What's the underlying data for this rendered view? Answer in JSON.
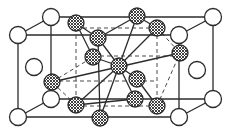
{
  "diagram": {
    "title": "",
    "type": "crystal-lattice-unit-cell",
    "colors": {
      "line": "#2b2b2b",
      "dashed": "#4a4a4a",
      "white_atom": "#ffffff",
      "hatch": "#2b2b2b"
    },
    "atom_radius": {
      "white": 8.5,
      "hatched": 8
    },
    "front_face": {
      "x1": 18,
      "y1": 35,
      "x2": 179,
      "y2": 117
    },
    "back_face": {
      "x1": 51,
      "y1": 17,
      "x2": 213,
      "y2": 99
    },
    "inner_dashed_box": {
      "x1": 76,
      "y1": 28,
      "x2": 157,
      "y2": 106
    },
    "white_atoms": [
      {
        "id": "corner-front-top-left",
        "x": 18,
        "y": 35
      },
      {
        "id": "corner-back-top-left",
        "x": 51,
        "y": 17
      },
      {
        "id": "corner-back-top-right",
        "x": 213,
        "y": 17
      },
      {
        "id": "corner-front-top-right",
        "x": 179,
        "y": 35
      },
      {
        "id": "corner-front-bottom-left",
        "x": 18,
        "y": 117
      },
      {
        "id": "corner-back-bottom-left",
        "x": 51,
        "y": 99
      },
      {
        "id": "corner-back-bottom-right",
        "x": 213,
        "y": 99
      },
      {
        "id": "corner-front-bottom-right",
        "x": 179,
        "y": 117
      },
      {
        "id": "face-left",
        "x": 34,
        "y": 67
      },
      {
        "id": "face-right",
        "x": 197,
        "y": 70
      }
    ],
    "hatched_atoms": [
      {
        "id": "top-back-left",
        "x": 76,
        "y": 23
      },
      {
        "id": "top-back-right",
        "x": 137,
        "y": 16
      },
      {
        "id": "top-right",
        "x": 157,
        "y": 28
      },
      {
        "id": "top-front",
        "x": 98,
        "y": 38
      },
      {
        "id": "mid-left-upper",
        "x": 93,
        "y": 57
      },
      {
        "id": "center",
        "x": 119,
        "y": 66
      },
      {
        "id": "mid-right-lower",
        "x": 137,
        "y": 79
      },
      {
        "id": "left-face-center",
        "x": 52,
        "y": 82
      },
      {
        "id": "right-face-center",
        "x": 180,
        "y": 53
      },
      {
        "id": "bottom-left",
        "x": 76,
        "y": 105
      },
      {
        "id": "bottom-back",
        "x": 135,
        "y": 99
      },
      {
        "id": "bottom-right",
        "x": 157,
        "y": 106
      },
      {
        "id": "bottom-front",
        "x": 100,
        "y": 118
      }
    ],
    "solid_bonds": [
      [
        119,
        66,
        98,
        38
      ],
      [
        119,
        66,
        137,
        16
      ],
      [
        119,
        66,
        93,
        57
      ],
      [
        119,
        66,
        137,
        79
      ],
      [
        119,
        66,
        135,
        99
      ],
      [
        119,
        66,
        100,
        118
      ],
      [
        119,
        66,
        76,
        105
      ],
      [
        119,
        66,
        157,
        28
      ],
      [
        52,
        82,
        180,
        53
      ],
      [
        98,
        38,
        76,
        23
      ],
      [
        98,
        38,
        137,
        16
      ],
      [
        137,
        79,
        157,
        106
      ],
      [
        98,
        38,
        100,
        118
      ],
      [
        76,
        105,
        135,
        99
      ],
      [
        93,
        57,
        76,
        23
      ],
      [
        137,
        16,
        157,
        28
      ]
    ],
    "dashed_bonds": [
      [
        52,
        82,
        93,
        57
      ],
      [
        157,
        28,
        180,
        53
      ],
      [
        76,
        105,
        52,
        82
      ],
      [
        157,
        106,
        180,
        53
      ]
    ]
  }
}
